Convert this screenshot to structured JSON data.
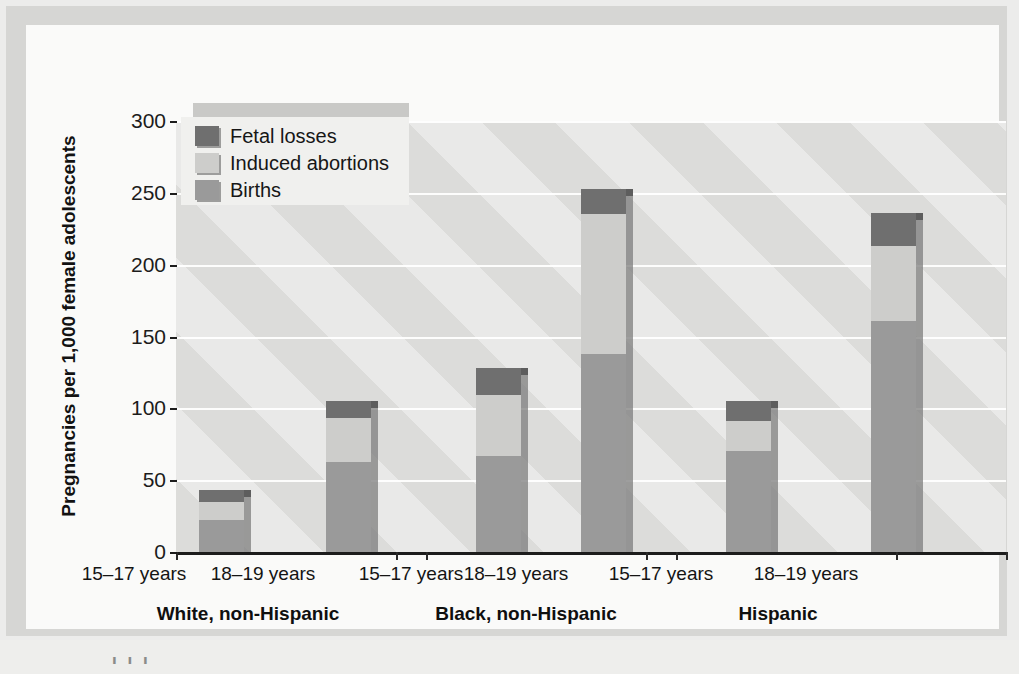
{
  "figure": {
    "background_color": "#d6d6d4",
    "card_color": "#fafaf9",
    "cut_off_caption": "I I I"
  },
  "chart_data": {
    "type": "bar",
    "subtype": "stacked-grouped",
    "title": "",
    "xlabel": "",
    "ylabel": "Pregnancies per 1,000 female adolescents",
    "ylim": [
      0,
      300
    ],
    "yticks": [
      0,
      50,
      100,
      150,
      200,
      250,
      300
    ],
    "ytick_labels": [
      "0",
      "50",
      "100",
      "150",
      "200",
      "250",
      "300"
    ],
    "grid": true,
    "grid_axis": "y",
    "legend_position": "upper-left-inside",
    "categories": [
      "White, non-Hispanic – 15–17 years",
      "White, non-Hispanic – 18–19 years",
      "Black, non-Hispanic – 15–17 years",
      "Black, non-Hispanic – 18–19 years",
      "Hispanic – 15–17 years",
      "Hispanic – 18–19 years"
    ],
    "series": [
      {
        "name": "Births",
        "color": "#9a9a9a",
        "values": [
          22,
          63,
          67,
          138,
          70,
          161
        ]
      },
      {
        "name": "Induced abortions",
        "color": "#cdcdcb",
        "values": [
          13,
          30,
          42,
          97,
          21,
          52
        ]
      },
      {
        "name": "Fetal losses",
        "color": "#6f6f6f",
        "values": [
          8,
          12,
          19,
          18,
          14,
          23
        ]
      }
    ],
    "totals": [
      43,
      105,
      128,
      253,
      105,
      236
    ]
  },
  "legend": {
    "items": [
      {
        "label": "Fetal losses",
        "color": "#6f6f6f"
      },
      {
        "label": "Induced abortions",
        "color": "#cdcdcb"
      },
      {
        "label": "Births",
        "color": "#9a9a9a"
      }
    ]
  },
  "axes": {
    "y_title": "Pregnancies per 1,000 female adolescents",
    "y_ticks": [
      "300",
      "250",
      "200",
      "150",
      "100",
      "50",
      "0"
    ]
  },
  "groups": [
    {
      "name": "White, non-Hispanic",
      "ages": [
        "15–17 years",
        "18–19 years"
      ]
    },
    {
      "name": "Black, non-Hispanic",
      "ages": [
        "15–17 years",
        "18–19 years"
      ]
    },
    {
      "name": "Hispanic",
      "ages": [
        "15–17 years",
        "18–19 years"
      ]
    }
  ]
}
